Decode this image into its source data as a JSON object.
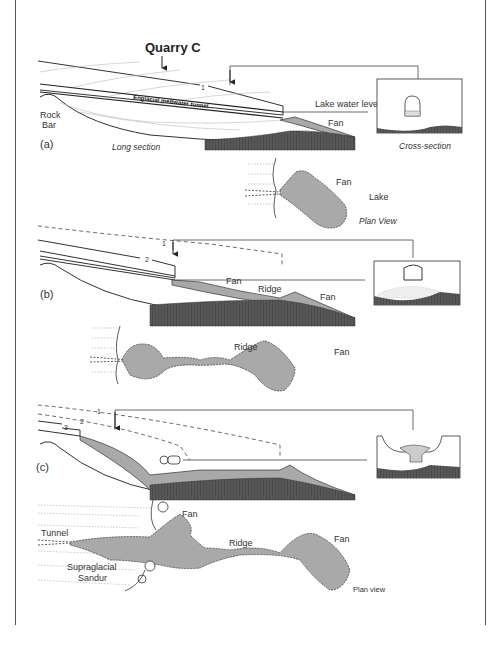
{
  "figure": {
    "title": "Quarry C",
    "panels": [
      {
        "id": "a",
        "label": "(a)",
        "long_section_label": "Long section",
        "cross_section_label": "Cross-section",
        "plan_view_label": "Plan View",
        "labels": {
          "rock_bar_1": "Rock",
          "rock_bar_2": "Bar",
          "tunnel": "Englacial meltwater tunnel",
          "lake_level": "Lake water level",
          "fan": "Fan",
          "plan_fan": "Fan",
          "plan_lake": "Lake",
          "ice_margin_number": "1"
        }
      },
      {
        "id": "b",
        "label": "(b)",
        "labels": {
          "fan_1": "Fan",
          "ridge": "Ridge",
          "fan_2": "Fan",
          "plan_ridge": "Ridge",
          "plan_fan": "Fan",
          "margin_1": "1",
          "margin_2": "2"
        }
      },
      {
        "id": "c",
        "label": "(c)",
        "labels": {
          "margin_1": "1",
          "margin_2": "2",
          "margin_3": "3",
          "plan_fan_1": "Fan",
          "plan_tunnel": "Tunnel",
          "plan_supraglacial_1": "Supraglacial",
          "plan_supraglacial_2": "Sandur",
          "plan_ridge": "Ridge",
          "plan_fan_2": "Fan",
          "plan_view": "Plan view"
        }
      }
    ],
    "colors": {
      "line": "#333333",
      "fan_fill": "#a9a9a9",
      "bedrock_fill": "#4a4a4a",
      "ice_lines": "#bbbbbb"
    }
  }
}
